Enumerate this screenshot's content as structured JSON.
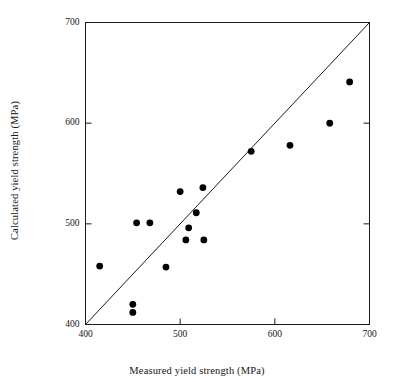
{
  "chart_data": {
    "type": "scatter",
    "title": "",
    "xlabel": "Measured yield strength (MPa)",
    "ylabel": "Calculated yield strength (MPa)",
    "xlim": [
      400,
      700
    ],
    "ylim": [
      400,
      700
    ],
    "xticks": [
      400,
      500,
      600,
      700
    ],
    "yticks": [
      400,
      500,
      600,
      700
    ],
    "xticklabels": [
      "400",
      "500",
      "600",
      "700"
    ],
    "yticklabels": [
      "400",
      "500",
      "600",
      "700"
    ],
    "grid": false,
    "legend": null,
    "annotations": [],
    "reference_line": {
      "name": "one-to-one line",
      "from": [
        400,
        400
      ],
      "to": [
        700,
        700
      ],
      "style": "solid"
    },
    "series": [
      {
        "name": "measured vs calculated yield strength",
        "marker": "filled-circle",
        "color": "#000000",
        "points": [
          [
            415,
            458
          ],
          [
            450,
            420
          ],
          [
            450,
            412
          ],
          [
            454,
            501
          ],
          [
            468,
            501
          ],
          [
            485,
            457
          ],
          [
            500,
            532
          ],
          [
            506,
            484
          ],
          [
            509,
            496
          ],
          [
            517,
            511
          ],
          [
            524,
            536
          ],
          [
            525,
            484
          ],
          [
            575,
            572
          ],
          [
            616,
            578
          ],
          [
            658,
            600
          ],
          [
            679,
            641
          ]
        ]
      }
    ]
  },
  "figure": {
    "background_color": "#ffffff",
    "axis_color": "#1a1a1a",
    "marker_color": "#000000"
  }
}
